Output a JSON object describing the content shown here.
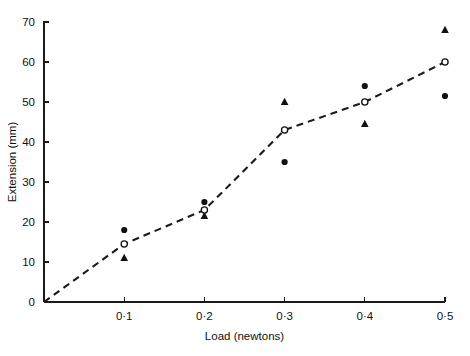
{
  "chart_data": {
    "type": "scatter",
    "title": "",
    "xlabel": "Load (newtons)",
    "ylabel": "Extension (mm)",
    "xlim": [
      0,
      0.5
    ],
    "ylim": [
      0,
      70
    ],
    "grid": false,
    "legend": "none",
    "x_tick_labels": [
      "0",
      "0·1",
      "0·2",
      "0·3",
      "0·4",
      "0·5"
    ],
    "x_tick_values": [
      0,
      0.1,
      0.2,
      0.3,
      0.4,
      0.5
    ],
    "y_tick_labels": [
      "0",
      "10",
      "20",
      "30",
      "40",
      "50",
      "60",
      "70"
    ],
    "y_tick_values": [
      0,
      10,
      20,
      30,
      40,
      50,
      60,
      70
    ],
    "series": [
      {
        "name": "filled-circle",
        "marker": "circle-filled",
        "x": [
          0.1,
          0.2,
          0.3,
          0.4,
          0.5
        ],
        "values": [
          18,
          25,
          35,
          54,
          51.5
        ]
      },
      {
        "name": "filled-triangle",
        "marker": "triangle-filled",
        "x": [
          0.1,
          0.2,
          0.3,
          0.4,
          0.5
        ],
        "values": [
          11,
          21.5,
          50,
          44.5,
          68
        ]
      },
      {
        "name": "mean-open-circle",
        "marker": "circle-open",
        "line": "dashed",
        "x": [
          0,
          0.1,
          0.2,
          0.3,
          0.4,
          0.5
        ],
        "values": [
          0,
          14.5,
          23,
          43,
          50,
          60
        ]
      }
    ]
  },
  "axes": {
    "x_title": "Load (newtons)",
    "y_title": "Extension (mm)"
  }
}
